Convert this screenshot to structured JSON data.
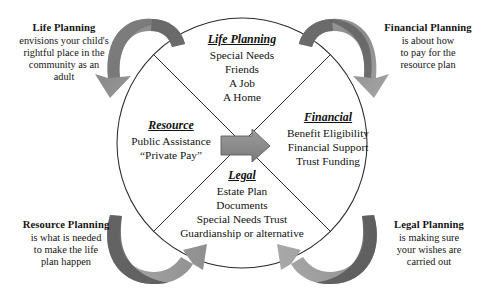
{
  "diagram": {
    "colors": {
      "arrow_dark": "#5e5e5e",
      "arrow_mid": "#868686",
      "arrow_light": "#a8a8a8",
      "circle_stroke": "#2b2b2b",
      "text": "#141414"
    },
    "center_arrow": {
      "name": "resource-to-financial-arrow",
      "direction": "right",
      "color": "#8a8a8a"
    },
    "circle": {
      "cx": 242,
      "cy": 143,
      "r": 125
    }
  },
  "captions": [
    {
      "id": "life",
      "title": "Life Planning",
      "body": "envisions your child's\nrightful place in the\ncommunity as an\nadult"
    },
    {
      "id": "financial",
      "title": "Financial Planning",
      "body": "is about how\nto pay for the\nresource plan"
    },
    {
      "id": "resource",
      "title": "Resource Planning",
      "body": "is what is needed\nto make the life\nplan happen"
    },
    {
      "id": "legal",
      "title": "Legal Planning",
      "body": "is making sure\nyour wishes are\ncarried out"
    }
  ],
  "quadrants": [
    {
      "id": "life",
      "title": "Life Planning",
      "items": "Special Needs\nFriends\nA Job\nA Home"
    },
    {
      "id": "financial",
      "title": "Financial",
      "items": "Benefit Eligibility\nFinancial Support\nTrust Funding"
    },
    {
      "id": "resource",
      "title": "Resource",
      "items": "Public Assistance\n“Private Pay”"
    },
    {
      "id": "legal",
      "title": "Legal",
      "items": "Estate Plan\nDocuments\nSpecial Needs Trust\nGuardianship or alternative"
    }
  ],
  "corner_arrows": [
    {
      "id": "top-left",
      "name": "curved-arrow-top-left"
    },
    {
      "id": "top-right",
      "name": "curved-arrow-top-right"
    },
    {
      "id": "bottom-left",
      "name": "curved-arrow-bottom-left"
    },
    {
      "id": "bottom-right",
      "name": "curved-arrow-bottom-right"
    }
  ]
}
